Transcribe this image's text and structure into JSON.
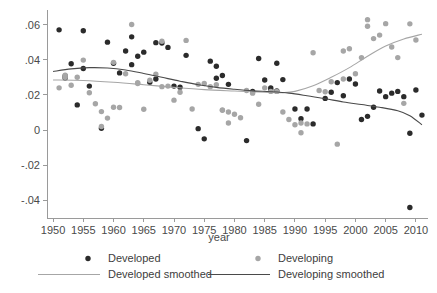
{
  "chart_data": {
    "type": "scatter",
    "title": "",
    "xlabel": "year",
    "ylabel": "",
    "xlim": [
      1949,
      2012
    ],
    "ylim": [
      -0.05,
      0.066
    ],
    "grid": false,
    "legend_position": "bottom",
    "xticks": [
      1950,
      1955,
      1960,
      1965,
      1970,
      1975,
      1980,
      1985,
      1990,
      1995,
      2000,
      2005,
      2010
    ],
    "yticks": [
      0.06,
      0.04,
      0.02,
      0,
      -0.02,
      -0.04
    ],
    "ytick_labels": [
      ".06",
      ".04",
      ".02",
      "0",
      "-.02",
      "-.04"
    ],
    "colors": {
      "developed": "#2b2b2b",
      "developing": "#a6a6a6",
      "developed_smoothed": "#a6a6a6",
      "developing_smoothed": "#4a4a4a"
    },
    "series": [
      {
        "name": "Developed",
        "type": "scatter",
        "color": "#2b2b2b",
        "points": [
          [
            1951,
            0.057
          ],
          [
            1952,
            0.0308
          ],
          [
            1952,
            0.0296
          ],
          [
            1953,
            0.0377
          ],
          [
            1954,
            0.0143
          ],
          [
            1955,
            0.0565
          ],
          [
            1955,
            0.035
          ],
          [
            1956,
            0.025
          ],
          [
            1958,
            0.001
          ],
          [
            1959,
            0.05
          ],
          [
            1960,
            0.038
          ],
          [
            1961,
            0.0325
          ],
          [
            1962,
            0.045
          ],
          [
            1963,
            0.0372
          ],
          [
            1963,
            0.053
          ],
          [
            1964,
            0.042
          ],
          [
            1965,
            0.0443
          ],
          [
            1966,
            0.0272
          ],
          [
            1967,
            0.029
          ],
          [
            1967,
            0.0497
          ],
          [
            1968,
            0.0495
          ],
          [
            1969,
            0.047
          ],
          [
            1970,
            0.025
          ],
          [
            1971,
            0.0244
          ],
          [
            1972,
            0.0425
          ],
          [
            1974,
            0.0008
          ],
          [
            1975,
            -0.005
          ],
          [
            1976,
            0.0392
          ],
          [
            1977,
            0.0295
          ],
          [
            1977,
            0.0363
          ],
          [
            1978,
            0.031
          ],
          [
            1979,
            0.026
          ],
          [
            1982,
            -0.006
          ],
          [
            1983,
            0.022
          ],
          [
            1984,
            0.0407
          ],
          [
            1985,
            0.0285
          ],
          [
            1986,
            0.024
          ],
          [
            1986,
            0.0228
          ],
          [
            1987,
            0.038
          ],
          [
            1987,
            0.0222
          ],
          [
            1988,
            0.0287
          ],
          [
            1990,
            0.012
          ],
          [
            1991,
            0.0065
          ],
          [
            1992,
            0.012
          ],
          [
            1993,
            0.0035
          ],
          [
            1995,
            0.018
          ],
          [
            1996,
            0.0215
          ],
          [
            1997,
            0.027
          ],
          [
            1998,
            0.0195
          ],
          [
            1999,
            0.029
          ],
          [
            2000,
            0.0262
          ],
          [
            2001,
            0.006
          ],
          [
            2002,
            0.0078
          ],
          [
            2003,
            0.013
          ],
          [
            2004,
            0.0222
          ],
          [
            2005,
            0.019
          ],
          [
            2006,
            0.021
          ],
          [
            2007,
            0.022
          ],
          [
            2008,
            0.019
          ],
          [
            2009,
            -0.044
          ],
          [
            2009,
            -0.0018
          ],
          [
            2010,
            0.0228
          ],
          [
            2011,
            0.0085
          ]
        ]
      },
      {
        "name": "Developing",
        "type": "scatter",
        "color": "#a6a6a6",
        "points": [
          [
            1951,
            0.024
          ],
          [
            1952,
            0.03
          ],
          [
            1952,
            0.0312
          ],
          [
            1953,
            0.0255
          ],
          [
            1954,
            0.03
          ],
          [
            1955,
            0.0398
          ],
          [
            1956,
            0.0212
          ],
          [
            1957,
            0.015
          ],
          [
            1958,
            0.0105
          ],
          [
            1958,
            0.002
          ],
          [
            1959,
            0.0068
          ],
          [
            1960,
            0.0385
          ],
          [
            1960,
            0.013
          ],
          [
            1961,
            0.0128
          ],
          [
            1962,
            0.032
          ],
          [
            1963,
            0.06
          ],
          [
            1964,
            0.0265
          ],
          [
            1964,
            0.027
          ],
          [
            1965,
            0.0118
          ],
          [
            1966,
            0.0283
          ],
          [
            1967,
            0.0318
          ],
          [
            1968,
            0.0247
          ],
          [
            1968,
            0.0505
          ],
          [
            1969,
            0.025
          ],
          [
            1970,
            0.017
          ],
          [
            1971,
            0.0215
          ],
          [
            1972,
            0.051
          ],
          [
            1973,
            0.012
          ],
          [
            1974,
            0.026
          ],
          [
            1975,
            0.0265
          ],
          [
            1976,
            0.0247
          ],
          [
            1977,
            0.0258
          ],
          [
            1978,
            0.0112
          ],
          [
            1978,
            0.0115
          ],
          [
            1979,
            0.004
          ],
          [
            1979,
            0.0103
          ],
          [
            1980,
            0.009
          ],
          [
            1981,
            0.007
          ],
          [
            1982,
            0.0225
          ],
          [
            1983,
            0.021
          ],
          [
            1984,
            0.0147
          ],
          [
            1985,
            0.024
          ],
          [
            1986,
            0.022
          ],
          [
            1987,
            0.022
          ],
          [
            1988,
            0.0103
          ],
          [
            1989,
            0.006
          ],
          [
            1990,
            0.003
          ],
          [
            1991,
            -0.0015
          ],
          [
            1991,
            0.004
          ],
          [
            1992,
            0.0035
          ],
          [
            1993,
            0.044
          ],
          [
            1994,
            0.0225
          ],
          [
            1995,
            0.0218
          ],
          [
            1996,
            0.0275
          ],
          [
            1997,
            -0.008
          ],
          [
            1998,
            0.045
          ],
          [
            1998,
            0.029
          ],
          [
            1999,
            0.0462
          ],
          [
            2000,
            0.032
          ],
          [
            2001,
            0.0412
          ],
          [
            2002,
            0.059
          ],
          [
            2002,
            0.0628
          ],
          [
            2003,
            0.052
          ],
          [
            2004,
            0.054
          ],
          [
            2005,
            0.0605
          ],
          [
            2006,
            0.0472
          ],
          [
            2007,
            0.0412
          ],
          [
            2008,
            0.0152
          ],
          [
            2009,
            0.0604
          ],
          [
            2010,
            0.0512
          ]
        ]
      },
      {
        "name": "Developed smoothed",
        "type": "line",
        "color": "#a6a6a6",
        "points": [
          [
            1950,
            0.0285
          ],
          [
            1955,
            0.0282
          ],
          [
            1960,
            0.0272
          ],
          [
            1965,
            0.0258
          ],
          [
            1970,
            0.0243
          ],
          [
            1975,
            0.023
          ],
          [
            1980,
            0.0222
          ],
          [
            1985,
            0.0215
          ],
          [
            1988,
            0.0213
          ],
          [
            1990,
            0.022
          ],
          [
            1993,
            0.0252
          ],
          [
            1996,
            0.03
          ],
          [
            1999,
            0.0355
          ],
          [
            2002,
            0.042
          ],
          [
            2005,
            0.0478
          ],
          [
            2008,
            0.0518
          ],
          [
            2011,
            0.0545
          ]
        ]
      },
      {
        "name": "Developing smoothed",
        "type": "line",
        "color": "#4a4a4a",
        "points": [
          [
            1950,
            0.0333
          ],
          [
            1953,
            0.0348
          ],
          [
            1956,
            0.0355
          ],
          [
            1959,
            0.0353
          ],
          [
            1962,
            0.0342
          ],
          [
            1965,
            0.0322
          ],
          [
            1968,
            0.03
          ],
          [
            1971,
            0.0278
          ],
          [
            1974,
            0.0258
          ],
          [
            1977,
            0.0243
          ],
          [
            1980,
            0.0232
          ],
          [
            1983,
            0.0223
          ],
          [
            1986,
            0.0218
          ],
          [
            1989,
            0.021
          ],
          [
            1992,
            0.0195
          ],
          [
            1995,
            0.0178
          ],
          [
            1998,
            0.016
          ],
          [
            2001,
            0.0145
          ],
          [
            2004,
            0.013
          ],
          [
            2007,
            0.011
          ],
          [
            2009,
            0.0082
          ],
          [
            2011,
            0.003
          ]
        ]
      }
    ]
  },
  "legend": {
    "entries": [
      {
        "label": "Developed",
        "marker": "dot",
        "color": "#2b2b2b"
      },
      {
        "label": "Developing",
        "marker": "dot",
        "color": "#a6a6a6"
      },
      {
        "label": "Developed smoothed",
        "marker": "line",
        "color": "#a6a6a6"
      },
      {
        "label": "Developing smoothed",
        "marker": "line",
        "color": "#4a4a4a"
      }
    ]
  }
}
